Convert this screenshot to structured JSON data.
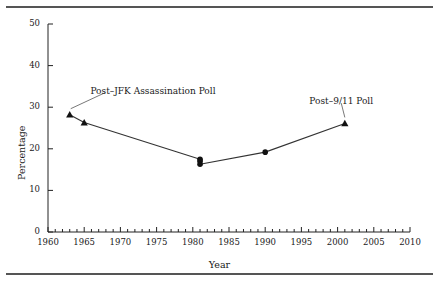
{
  "figure": {
    "has_top_rule": true,
    "has_bottom_rule": true
  },
  "chart_data": {
    "type": "line",
    "title": "",
    "xlabel": "Year",
    "ylabel": "Percentage",
    "xlim": [
      1960,
      2010
    ],
    "ylim": [
      0,
      50
    ],
    "grid": false,
    "legend": "none",
    "xticks": [
      1960,
      1965,
      1970,
      1975,
      1980,
      1985,
      1990,
      1995,
      2000,
      2005,
      2010
    ],
    "xtick_labels": [
      "1960",
      "1965",
      "1970",
      "1975",
      "1980",
      "1985",
      "1990",
      "1995",
      "2000",
      "2005",
      "2010"
    ],
    "x_minor_tick_interval": 1,
    "yticks": [
      0,
      10,
      20,
      30,
      40,
      50
    ],
    "ytick_labels": [
      "0",
      "10",
      "20",
      "30",
      "40",
      "50"
    ],
    "series": [
      {
        "name": "Percentage",
        "x": [
          1963,
          1965,
          1981,
          1981,
          1981,
          1990,
          2001
        ],
        "values": [
          28.2,
          26.3,
          17.5,
          17.0,
          16.3,
          19.2,
          26.1
        ],
        "markers": [
          "triangle",
          "triangle",
          "circle",
          "circle",
          "circle",
          "circle",
          "triangle"
        ],
        "line_color": "#333333",
        "marker_color": "#111111"
      }
    ],
    "annotations": [
      {
        "text": "Post–9/11 Poll",
        "label_x": 2000.5,
        "label_y": 30.5,
        "point_x": 2001,
        "point_y": 26.1,
        "align": "center"
      },
      {
        "text": "Post–JFK Assassination Poll",
        "label_x": 1974.5,
        "label_y": 33.0,
        "point_x": 1963,
        "point_y": 28.2,
        "align": "center"
      }
    ]
  }
}
